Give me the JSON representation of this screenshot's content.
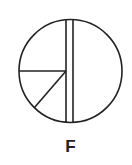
{
  "figure": {
    "label": "F",
    "stroke_color": "#222222",
    "circle": {
      "cx": 70.5,
      "cy": 71,
      "r": 51.5
    },
    "vertical_bars": [
      {
        "x": 66
      },
      {
        "x": 73
      }
    ],
    "horizontal_segment": {
      "y": 71,
      "x_end": 66
    },
    "diagonal_segment": {
      "from": [
        66,
        71
      ],
      "to": [
        34,
        108
      ]
    }
  }
}
